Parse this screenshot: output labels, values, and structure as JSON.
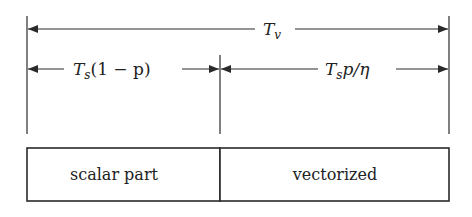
{
  "diagram": {
    "total_time_label": {
      "main": "T",
      "sub": "v"
    },
    "scalar_time_label": {
      "main": "T",
      "sub": "s",
      "rest": "(1 − p)"
    },
    "vector_time_label": {
      "main": "T",
      "sub": "s",
      "rest": "p/η"
    },
    "boxes": [
      {
        "label": "scalar part"
      },
      {
        "label": "vectorized"
      }
    ],
    "colors": {
      "line": "#2a2a2a",
      "background": "#ffffff",
      "text": "#222222"
    }
  }
}
